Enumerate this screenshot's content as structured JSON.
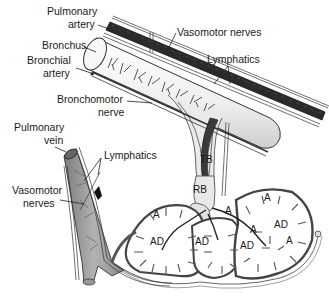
{
  "diagram": {
    "labels": {
      "pulmonary_artery_1": "Pulmonary",
      "pulmonary_artery_2": "artery",
      "vasomotor_nerves_top": "Vasomotor nerves",
      "bronchus": "Bronchus",
      "bronchial_artery_1": "Bronchial",
      "bronchial_artery_2": "artery",
      "lymphatics_top": "Lymphatics",
      "bronchomotor_nerve_1": "Bronchomotor",
      "bronchomotor_nerve_2": "nerve",
      "pulmonary_vein_1": "Pulmonary",
      "pulmonary_vein_2": "vein",
      "lymphatics_left": "Lymphatics",
      "vasomotor_nerves_left_1": "Vasomotor",
      "vasomotor_nerves_left_2": "nerves",
      "tb": "TB",
      "rb": "RB",
      "alveolus": "A",
      "alveolar_duct": "AD"
    },
    "colors": {
      "artery_dark": "#2b2b2b",
      "bronchus_fill": "#f2f2f2",
      "vein_fill": "#9a9a9a",
      "outline": "#333333",
      "background": "#ffffff"
    }
  }
}
